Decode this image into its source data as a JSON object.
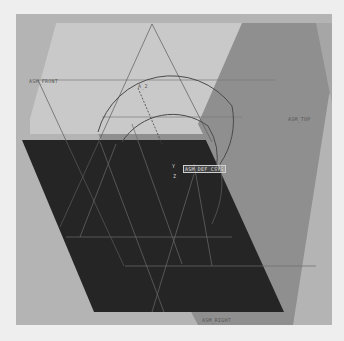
{
  "viewport": {
    "background": "#b4b4b4",
    "page_background": "#eeeeee"
  },
  "planes": {
    "front": {
      "label": "ASM_FRONT",
      "color": "#c9c9c9"
    },
    "top": {
      "label": "ASM_TOP",
      "color": "#8f8f8f"
    },
    "right": {
      "label": "ASM_RIGHT",
      "color": "#252525"
    }
  },
  "csys": {
    "label": "ASM_DEF_CSYS",
    "axis_y": "Y",
    "axis_z": "Z"
  },
  "dimension": {
    "label": "A_2"
  },
  "colors": {
    "sketch_line": "#4a4a4a",
    "datum_edge_light": "#7a7a7a",
    "datum_edge_dark": "#6a6a6a"
  }
}
